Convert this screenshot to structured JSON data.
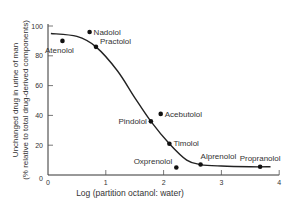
{
  "chart_data": {
    "type": "scatter",
    "title": "",
    "xlabel": "Log (partition octanol: water)",
    "ylabel_line1": "Unchanged drug in urine of man",
    "ylabel_line2": "(% relative to total drug-derived components)",
    "xlim": [
      0,
      4
    ],
    "ylim": [
      0,
      100
    ],
    "x_ticks": [
      0,
      1,
      2,
      3,
      4
    ],
    "y_ticks": [
      0,
      20,
      40,
      60,
      80,
      100
    ],
    "grid": false,
    "legend": "none",
    "points": [
      {
        "name": "Atenolol",
        "x": 0.25,
        "y": 90
      },
      {
        "name": "Nadolol",
        "x": 0.72,
        "y": 96
      },
      {
        "name": "Practolol",
        "x": 0.83,
        "y": 86
      },
      {
        "name": "Pindolol",
        "x": 1.78,
        "y": 36
      },
      {
        "name": "Acebutolol",
        "x": 1.95,
        "y": 41
      },
      {
        "name": "Timolol",
        "x": 2.1,
        "y": 21
      },
      {
        "name": "Oxprenolol",
        "x": 2.22,
        "y": 5
      },
      {
        "name": "Alprenolol",
        "x": 2.64,
        "y": 7
      },
      {
        "name": "Propranolol",
        "x": 3.67,
        "y": 5.5
      }
    ],
    "fitted_curve": {
      "x": [
        0.05,
        0.5,
        0.83,
        1.2,
        1.5,
        1.78,
        2.1,
        2.4,
        2.64,
        3.0,
        3.5,
        3.85
      ],
      "y": [
        95,
        93,
        86,
        70,
        52,
        36,
        21,
        10,
        7,
        6,
        5.5,
        5.5
      ]
    }
  }
}
